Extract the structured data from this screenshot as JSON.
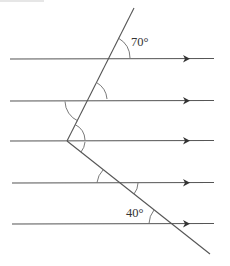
{
  "diagram": {
    "parallel_lines": [
      {
        "id": "line-1",
        "y": 59,
        "x1": 10,
        "x2": 214,
        "arrow_x": 186
      },
      {
        "id": "line-2",
        "y": 101,
        "x1": 10,
        "x2": 214,
        "arrow_x": 186
      },
      {
        "id": "line-3",
        "y": 141,
        "x1": 10,
        "x2": 214,
        "arrow_x": 186
      },
      {
        "id": "line-4",
        "y": 183,
        "x1": 12,
        "x2": 214,
        "arrow_x": 186
      },
      {
        "id": "line-5",
        "y": 224,
        "x1": 12,
        "x2": 214,
        "arrow_x": 186
      }
    ],
    "transversal": {
      "vertex": [
        67,
        141
      ],
      "upper_end": [
        134,
        8
      ],
      "lower_end": [
        210,
        254
      ]
    },
    "angle_labels": {
      "top": "70°",
      "bottom": "40°"
    },
    "colors": {
      "line": "#555555",
      "arc": "#6a6a6a",
      "text": "#333333",
      "background": "#ffffff"
    }
  }
}
